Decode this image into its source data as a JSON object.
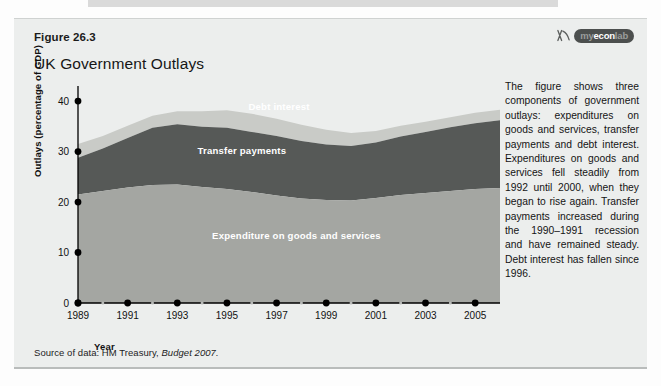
{
  "figure": {
    "number": "Figure 26.3",
    "title": "UK Government Outlays",
    "source": "Source of data: HM Treasury,",
    "source_italic": "Budget 2007.",
    "ghost_heading": "UK Government Budget Balance and Debt"
  },
  "logo": {
    "mark_name": "myeconlab-swoosh-icon",
    "text_prefix": "my",
    "text_mid": "econ",
    "text_suffix": "lab",
    "full_text": "myeconlab"
  },
  "caption": {
    "text": "The figure shows three components of government outlays: expenditures on goods and services, transfer payments and debt interest. Expenditures on goods and services fell steadily from 1992 until 2000, when they began to rise again. Transfer payments increased during the 1990–1991 recession and have remained steady. Debt interest has fallen since 1996."
  },
  "chart_data": {
    "type": "area",
    "stacked": true,
    "title": "UK Government Outlays",
    "xlabel": "Year",
    "ylabel": "Outlays (percentage of GDP)",
    "xlim": [
      1989,
      2006
    ],
    "ylim": [
      0,
      42
    ],
    "yticks": [
      0,
      10,
      20,
      30,
      40
    ],
    "ytick_labels": [
      "0",
      "10",
      "20",
      "30",
      "40"
    ],
    "xticks": [
      1989,
      1991,
      1993,
      1995,
      1997,
      1999,
      2001,
      2003,
      2005
    ],
    "xtick_labels": [
      "1989",
      "1991",
      "1993",
      "1995",
      "1997",
      "1999",
      "2001",
      "2003",
      "2005"
    ],
    "minor_xticks": [
      1990,
      1992,
      1994,
      1996,
      1998,
      2000,
      2002,
      2004
    ],
    "grid": false,
    "legend_position": "inside-labels",
    "x": [
      1989,
      1990,
      1991,
      1992,
      1993,
      1994,
      1995,
      1996,
      1997,
      1998,
      1999,
      2000,
      2001,
      2002,
      2003,
      2004,
      2005,
      2006
    ],
    "series": [
      {
        "name": "Expenditure on goods and services",
        "color": "#a4a6a2",
        "label_color": "#ffffff",
        "values": [
          21.5,
          22.2,
          22.9,
          23.4,
          23.5,
          23.0,
          22.6,
          22.0,
          21.3,
          20.7,
          20.4,
          20.3,
          20.8,
          21.4,
          21.8,
          22.2,
          22.6,
          22.8
        ]
      },
      {
        "name": "Transfer payments",
        "color": "#565957",
        "label_color": "#ffffff",
        "values": [
          7.3,
          8.4,
          9.8,
          11.3,
          11.9,
          11.9,
          12.1,
          11.9,
          11.8,
          11.4,
          11.0,
          10.8,
          11.0,
          11.6,
          12.1,
          12.6,
          13.0,
          13.4
        ]
      },
      {
        "name": "Debt interest",
        "color": "#c9cbc7",
        "label_color": "#ffffff",
        "values": [
          2.7,
          2.5,
          2.4,
          2.4,
          2.6,
          3.1,
          3.5,
          3.6,
          3.4,
          3.2,
          2.9,
          2.6,
          2.3,
          2.1,
          2.0,
          2.0,
          2.1,
          2.1
        ]
      }
    ],
    "inline_labels": [
      {
        "text": "Debt interest",
        "x": 1997.1,
        "y": 38.3,
        "anchor": "middle",
        "color": "#ffffff"
      },
      {
        "text": "Transfer payments",
        "x": 1995.6,
        "y": 29.6,
        "anchor": "middle",
        "color": "#ffffff"
      },
      {
        "text": "Expenditure on goods and services",
        "x": 1997.8,
        "y": 12.6,
        "anchor": "middle",
        "color": "#ffffff"
      }
    ]
  },
  "colors": {
    "panel_bg": "#eceeed",
    "axis": "#000000",
    "text": "#141414"
  }
}
